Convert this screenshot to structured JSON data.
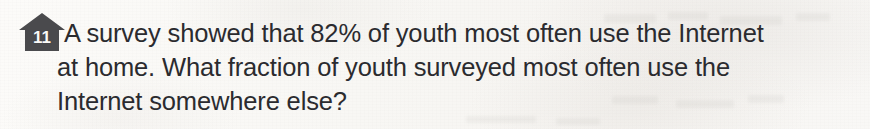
{
  "page": {
    "background_color": "#f8f7f4",
    "text_color": "#2b2b2f",
    "badge_color": "#4a4a4d",
    "badge_text_color": "#fbfaf8",
    "media": "scanned-textbook-page"
  },
  "problem": {
    "number": "11",
    "badge_icon": "house-icon",
    "lines": [
      "A survey showed that 82% of youth most often use the Internet",
      "at home. What fraction of youth surveyed most often use the",
      "Internet somewhere else?"
    ],
    "full_text": "A survey showed that 82% of youth most often use the Internet at home. What fraction of youth surveyed most often use the Internet somewhere else?",
    "percent_value": "82%"
  }
}
